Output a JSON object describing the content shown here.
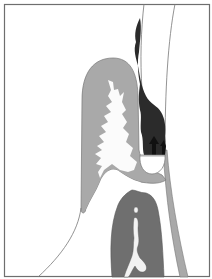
{
  "figure": {
    "colors": {
      "background": "#ffffff",
      "frame": "#6e6e6e",
      "light_gray_region": "#a9a9a9",
      "dark_gray_region": "#6f6f6f",
      "black_region": "#2b2b2b",
      "outline": "#777777",
      "white_core": "#fbfbfb"
    }
  }
}
